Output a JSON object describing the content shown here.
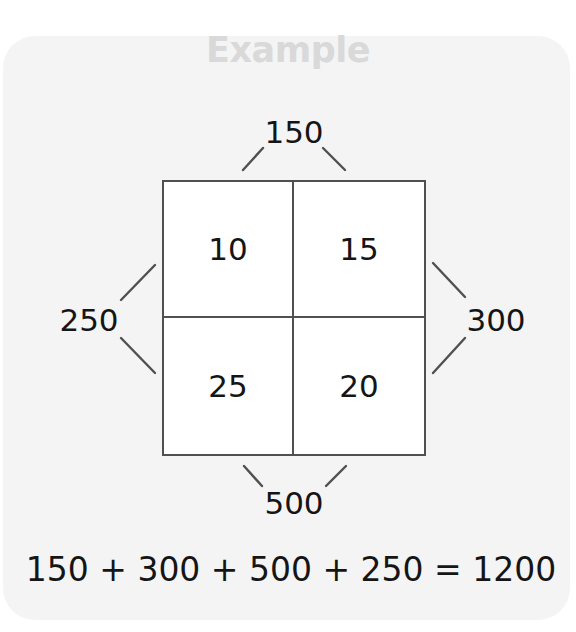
{
  "title": "Example",
  "grid": {
    "cells": [
      "10",
      "15",
      "25",
      "20"
    ]
  },
  "edges": {
    "top": "150",
    "right": "300",
    "bottom": "500",
    "left": "250"
  },
  "equation": "150 + 300 + 500 + 250 = 1200",
  "colors": {
    "card_background": "#f4f4f4",
    "title": "#d9d9d9",
    "grid_border": "#505050",
    "text": "#151515"
  }
}
